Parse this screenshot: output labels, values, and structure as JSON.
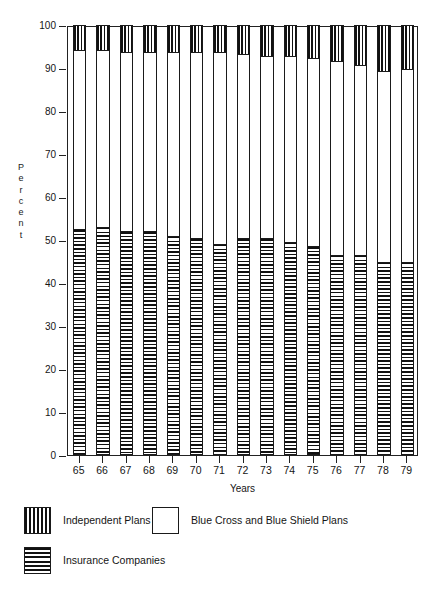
{
  "chart_data": {
    "type": "bar",
    "subtype": "stacked-bar-100-percent",
    "title": "",
    "xlabel": "Years",
    "ylabel": "Percent",
    "ylabel_letters": [
      "P",
      "e",
      "r",
      "c",
      "e",
      "n",
      "t"
    ],
    "ylim": [
      0,
      100
    ],
    "yticks": [
      0,
      10,
      20,
      30,
      40,
      50,
      60,
      70,
      80,
      90,
      100
    ],
    "ytick_labels": [
      "0",
      "10",
      "20",
      "30",
      "40",
      "50",
      "60",
      "70",
      "80",
      "90",
      "100"
    ],
    "grid": false,
    "legend_position": "below-plot",
    "categories": [
      "65",
      "66",
      "67",
      "68",
      "69",
      "70",
      "71",
      "72",
      "73",
      "74",
      "75",
      "76",
      "77",
      "78",
      "79"
    ],
    "series": [
      {
        "name": "Insurance Companies",
        "pattern": "horizontal-stripes",
        "stack_order": 0,
        "values": [
          52.5,
          53.0,
          52.0,
          52.0,
          51.0,
          50.5,
          49.0,
          50.5,
          50.5,
          49.5,
          48.5,
          46.5,
          46.5,
          45.0,
          45.0
        ]
      },
      {
        "name": "Blue Cross and Blue Shield Plans",
        "pattern": "solid-white",
        "stack_order": 1,
        "values": [
          41.5,
          41.0,
          41.5,
          41.5,
          42.5,
          43.0,
          44.5,
          42.5,
          42.0,
          43.0,
          43.5,
          45.0,
          44.0,
          44.0,
          44.5
        ]
      },
      {
        "name": "Independent Plans",
        "pattern": "vertical-stripes",
        "stack_order": 2,
        "values": [
          6.0,
          6.0,
          6.5,
          6.5,
          6.5,
          6.5,
          6.5,
          7.0,
          7.5,
          7.5,
          8.0,
          8.5,
          9.5,
          11.0,
          10.5
        ]
      }
    ],
    "colors": {
      "line": "#1a1a1a",
      "fill": "#ffffff",
      "background": "#ffffff"
    }
  },
  "axes": {
    "x_title": "Years",
    "y_title": "Percent"
  },
  "legend": {
    "items": [
      {
        "label": "Independent Plans",
        "swatch": "vertical-stripes"
      },
      {
        "label": "Blue Cross and Blue Shield Plans",
        "swatch": "solid-white"
      },
      {
        "label": "Insurance Companies",
        "swatch": "horizontal-stripes"
      }
    ]
  }
}
